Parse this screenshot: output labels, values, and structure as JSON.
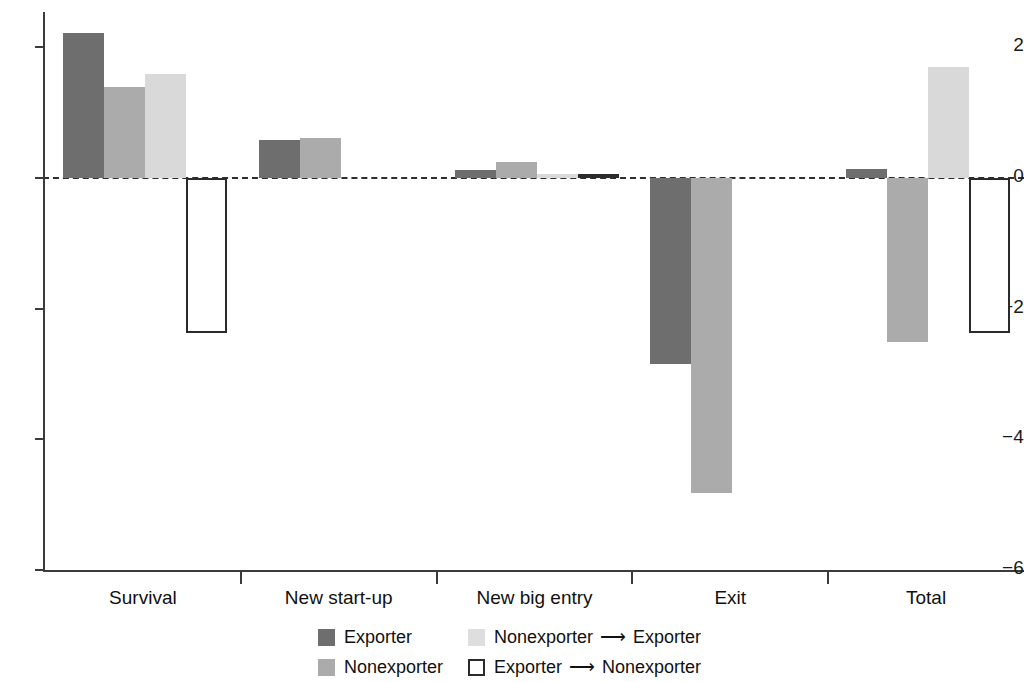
{
  "chart_data": {
    "type": "bar",
    "title": "",
    "subtitle": "",
    "xlabel": "",
    "ylabel": "",
    "grid": false,
    "legend_position": "bottom",
    "ylim": [
      -6,
      2.6
    ],
    "yticks": [
      2,
      0,
      -2,
      -4,
      -6
    ],
    "ytick_labels": [
      "2",
      "0",
      "−2",
      "−4",
      "−6"
    ],
    "zero_line": true,
    "zero_line_style": "dashed",
    "categories": [
      "Survival",
      "New start-up",
      "New big entry",
      "Exit",
      "Total"
    ],
    "series": [
      {
        "name": "Exporter",
        "color": "#6e6e6e",
        "style": "filled",
        "values": [
          2.22,
          0.58,
          0.12,
          -2.85,
          0.14
        ]
      },
      {
        "name": "Nonexporter",
        "color": "#ababab",
        "style": "filled",
        "values": [
          1.4,
          0.62,
          0.24,
          -4.82,
          -2.51
        ]
      },
      {
        "name": "Nonexporter → Exporter",
        "color": "#d9d9d9",
        "style": "filled",
        "values": [
          1.6,
          0.0,
          0.06,
          0.0,
          1.7
        ]
      },
      {
        "name": "Exporter → Nonexporter",
        "color": "#ffffff",
        "style": "outlined",
        "values": [
          -2.38,
          0.0,
          0.06,
          0.0,
          -2.38
        ]
      }
    ]
  },
  "axis": {
    "y_tick_labels": [
      "2",
      "0",
      "−2",
      "−4",
      "−6"
    ],
    "category_labels": [
      "Survival",
      "New start-up",
      "New big entry",
      "Exit",
      "Total"
    ]
  },
  "legend": {
    "items": [
      {
        "label": "Exporter",
        "swatch": "exporter"
      },
      {
        "label": "Nonexporter",
        "swatch": "nonexporter"
      },
      {
        "label_left": "Nonexporter",
        "arrow": "⟶",
        "label_right": "Exporter",
        "swatch": "non-to-exp"
      },
      {
        "label_left": "Exporter",
        "arrow": "⟶",
        "label_right": "Nonexporter",
        "swatch": "exp-to-non"
      }
    ]
  }
}
